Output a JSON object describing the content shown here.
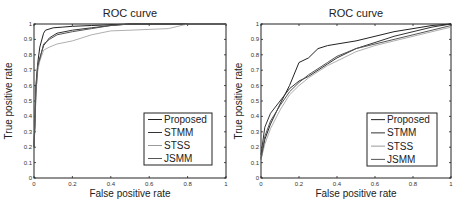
{
  "chart_data": [
    {
      "type": "line",
      "title": "ROC curve",
      "xlabel": "False positive rate",
      "ylabel": "True positive rate",
      "xlim": [
        0,
        1
      ],
      "ylim": [
        0,
        1
      ],
      "xticks": [
        "0",
        "0.2",
        "0.4",
        "0.6",
        "0.8",
        "1"
      ],
      "yticks": [
        "0",
        "0.1",
        "0.2",
        "0.3",
        "0.4",
        "0.5",
        "0.6",
        "0.7",
        "0.8",
        "0.9",
        "1"
      ],
      "grid": false,
      "legend_position": "lower right",
      "series": [
        {
          "name": "Proposed",
          "color": "#222222",
          "x": [
            0,
            0.005,
            0.01,
            0.02,
            0.03,
            0.05,
            0.06,
            0.1,
            0.15,
            0.2,
            0.3,
            0.5,
            1
          ],
          "y": [
            0.2,
            0.4,
            0.6,
            0.75,
            0.85,
            0.94,
            0.96,
            0.975,
            0.98,
            0.985,
            0.99,
            1.0,
            1.0
          ]
        },
        {
          "name": "STMM",
          "color": "#333333",
          "x": [
            0,
            0.005,
            0.01,
            0.02,
            0.03,
            0.05,
            0.08,
            0.12,
            0.2,
            0.3,
            0.4,
            0.5,
            1
          ],
          "y": [
            0.2,
            0.35,
            0.55,
            0.72,
            0.78,
            0.86,
            0.91,
            0.94,
            0.96,
            0.975,
            0.99,
            1.0,
            1.0
          ]
        },
        {
          "name": "STSS",
          "color": "#9a9a9a",
          "x": [
            0,
            0.005,
            0.01,
            0.02,
            0.03,
            0.05,
            0.08,
            0.12,
            0.2,
            0.3,
            0.4,
            0.5,
            0.6,
            0.7,
            0.8,
            1
          ],
          "y": [
            0.2,
            0.35,
            0.55,
            0.7,
            0.76,
            0.83,
            0.85,
            0.87,
            0.89,
            0.93,
            0.955,
            0.96,
            0.965,
            0.97,
            1.0,
            1.0
          ]
        },
        {
          "name": "JSMM",
          "color": "#555555",
          "x": [
            0,
            0.005,
            0.01,
            0.02,
            0.03,
            0.05,
            0.08,
            0.12,
            0.2,
            0.3,
            0.4,
            0.5,
            1
          ],
          "y": [
            0.2,
            0.38,
            0.58,
            0.74,
            0.77,
            0.87,
            0.9,
            0.93,
            0.95,
            0.97,
            0.99,
            1.0,
            1.0
          ]
        }
      ]
    },
    {
      "type": "line",
      "title": "ROC curve",
      "xlabel": "False positive rate",
      "ylabel": "True positive rate",
      "xlim": [
        0,
        1
      ],
      "ylim": [
        0,
        1
      ],
      "xticks": [
        "0",
        "0.2",
        "0.4",
        "0.6",
        "0.8",
        "1"
      ],
      "yticks": [
        "0",
        "0.1",
        "0.2",
        "0.3",
        "0.4",
        "0.5",
        "0.6",
        "0.7",
        "0.8",
        "0.9",
        "1"
      ],
      "grid": false,
      "legend_position": "lower right",
      "series": [
        {
          "name": "Proposed",
          "color": "#222222",
          "x": [
            0,
            0.02,
            0.05,
            0.1,
            0.15,
            0.2,
            0.25,
            0.3,
            0.35,
            0.4,
            0.5,
            0.6,
            0.7,
            0.8,
            0.9,
            1
          ],
          "y": [
            0.12,
            0.25,
            0.35,
            0.48,
            0.6,
            0.75,
            0.78,
            0.84,
            0.86,
            0.87,
            0.89,
            0.92,
            0.95,
            0.97,
            0.99,
            1.0
          ]
        },
        {
          "name": "STMM",
          "color": "#333333",
          "x": [
            0,
            0.02,
            0.05,
            0.1,
            0.15,
            0.2,
            0.25,
            0.3,
            0.35,
            0.4,
            0.5,
            0.6,
            0.7,
            0.8,
            0.9,
            1
          ],
          "y": [
            0.15,
            0.33,
            0.42,
            0.5,
            0.58,
            0.63,
            0.66,
            0.7,
            0.74,
            0.78,
            0.84,
            0.88,
            0.92,
            0.95,
            0.98,
            1.0
          ]
        },
        {
          "name": "STSS",
          "color": "#9a9a9a",
          "x": [
            0,
            0.02,
            0.05,
            0.1,
            0.15,
            0.2,
            0.25,
            0.3,
            0.35,
            0.4,
            0.5,
            0.6,
            0.7,
            0.8,
            0.9,
            1
          ],
          "y": [
            0.12,
            0.22,
            0.32,
            0.44,
            0.54,
            0.6,
            0.65,
            0.69,
            0.73,
            0.76,
            0.82,
            0.86,
            0.89,
            0.92,
            0.95,
            0.98
          ]
        },
        {
          "name": "JSMM",
          "color": "#555555",
          "x": [
            0,
            0.02,
            0.05,
            0.1,
            0.15,
            0.2,
            0.25,
            0.3,
            0.35,
            0.4,
            0.5,
            0.6,
            0.7,
            0.8,
            0.9,
            1
          ],
          "y": [
            0.13,
            0.27,
            0.37,
            0.47,
            0.56,
            0.62,
            0.67,
            0.71,
            0.75,
            0.79,
            0.84,
            0.87,
            0.9,
            0.93,
            0.96,
            0.99
          ]
        }
      ]
    }
  ]
}
